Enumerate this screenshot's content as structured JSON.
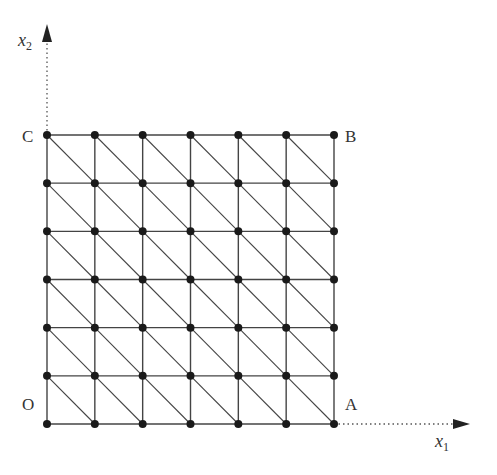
{
  "diagram": {
    "type": "triangular-mesh",
    "grid": {
      "cols": 6,
      "rows": 6,
      "diagonal": "top-left-to-bottom-right"
    },
    "corner_labels": {
      "origin": "O",
      "a": "A",
      "b": "B",
      "c": "C"
    },
    "axes": {
      "x": {
        "symbol": "x",
        "subscript": "1"
      },
      "y": {
        "symbol": "x",
        "subscript": "2"
      }
    },
    "colors": {
      "mesh": "#444444",
      "node": "#1a1a1a",
      "axis": "#555555"
    }
  }
}
